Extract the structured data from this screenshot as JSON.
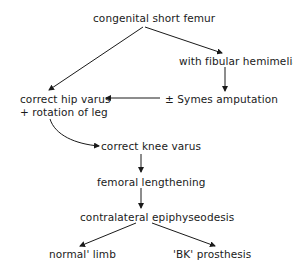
{
  "diagram": {
    "type": "flowchart",
    "nodes": {
      "root": "congenital short femur",
      "fibular": "with fibular hemimelia",
      "symes": "± Symes amputation",
      "hip_line1": "correct hip varus",
      "hip_line2": "+ rotation of leg",
      "knee": "correct knee varus",
      "lengthening": "femoral lengthening",
      "epiphyseodesis": "contralateral epiphyseodesis",
      "normal": "normal' limb",
      "prosthesis": "'BK' prosthesis"
    },
    "edges": [
      {
        "from": "congenital short femur",
        "to": "correct hip varus + rotation of leg"
      },
      {
        "from": "congenital short femur",
        "to": "with fibular hemimelia"
      },
      {
        "from": "with fibular hemimelia",
        "to": "± Symes amputation"
      },
      {
        "from": "± Symes amputation",
        "to": "correct hip varus + rotation of leg"
      },
      {
        "from": "correct hip varus + rotation of leg",
        "to": "correct knee varus",
        "style": "curved"
      },
      {
        "from": "correct knee varus",
        "to": "femoral lengthening"
      },
      {
        "from": "femoral lengthening",
        "to": "contralateral epiphyseodesis"
      },
      {
        "from": "contralateral epiphyseodesis",
        "to": "normal' limb"
      },
      {
        "from": "contralateral epiphyseodesis",
        "to": "'BK' prosthesis"
      }
    ]
  }
}
